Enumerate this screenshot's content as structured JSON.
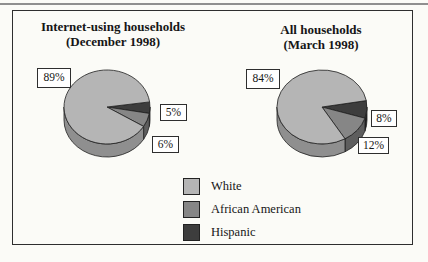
{
  "chart_data": [
    {
      "type": "pie",
      "title": "Internet-using households",
      "subtitle": "(December 1998)",
      "labels": [
        "White",
        "African American",
        "Hispanic"
      ],
      "values": [
        89,
        6,
        5
      ],
      "value_labels": [
        "89%",
        "6%",
        "5%"
      ],
      "style": "3d-pie",
      "legend_position": "bottom-center-shared"
    },
    {
      "type": "pie",
      "title": "All households",
      "subtitle": "(March 1998)",
      "labels": [
        "White",
        "African American",
        "Hispanic"
      ],
      "values": [
        84,
        12,
        8
      ],
      "value_labels": [
        "84%",
        "12%",
        "8%"
      ],
      "style": "3d-pie",
      "legend_position": "bottom-center-shared"
    }
  ],
  "legend": {
    "items": [
      {
        "label": "White",
        "color": "#b5b5b5",
        "side_color": "#8f8f8f"
      },
      {
        "label": "African American",
        "color": "#868686",
        "side_color": "#5e5e5e"
      },
      {
        "label": "Hispanic",
        "color": "#3d3d3d",
        "side_color": "#242424"
      }
    ]
  }
}
